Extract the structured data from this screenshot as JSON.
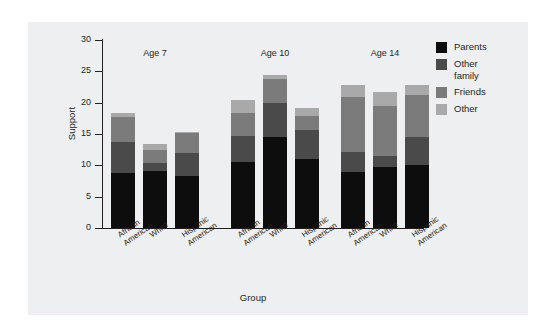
{
  "figure": {
    "background_color": "#ffffff",
    "panel_color": "#eeeff0",
    "axis_color": "#231f20"
  },
  "chart_data": {
    "type": "bar",
    "subtype": "stacked",
    "title": "",
    "xlabel": "Group",
    "ylabel": "Support",
    "ylim": [
      0,
      30
    ],
    "yticks": [
      0,
      5,
      10,
      15,
      20,
      25,
      30
    ],
    "ytick_labels": [
      "0",
      "5",
      "10",
      "15",
      "20",
      "25",
      "30"
    ],
    "grid": false,
    "legend_position": "right",
    "group_labels": [
      "Age 7",
      "Age 10",
      "Age 14"
    ],
    "categories": [
      "African\nAmerican",
      "White",
      "Hispanic\nAmerican",
      "African\nAmerican",
      "White",
      "Hispanic\nAmerican",
      "African\nAmerican",
      "White",
      "Hispanic\nAmerican"
    ],
    "series": [
      {
        "name": "Parents",
        "color": "#0d0d0d",
        "values": [
          8.8,
          9.1,
          8.3,
          10.6,
          14.6,
          11.0,
          9.0,
          9.7,
          10.0
        ]
      },
      {
        "name": "Other\nfamily",
        "color": "#4a4a4a",
        "values": [
          4.9,
          1.2,
          3.7,
          4.1,
          5.3,
          4.7,
          3.2,
          1.8,
          4.6
        ]
      },
      {
        "name": "Friends",
        "color": "#7b7b7b",
        "values": [
          4.0,
          2.2,
          3.1,
          3.7,
          3.9,
          2.2,
          8.7,
          8.0,
          6.6
        ]
      },
      {
        "name": "Other",
        "color": "#a9a9a9",
        "values": [
          0.7,
          0.9,
          0.3,
          2.1,
          0.7,
          1.2,
          2.0,
          2.2,
          1.6
        ]
      }
    ],
    "totals": [
      18.4,
      13.4,
      15.4,
      20.5,
      24.5,
      19.1,
      22.9,
      21.7,
      22.8
    ]
  },
  "legend": {
    "items": [
      {
        "label": "Parents",
        "color": "#0d0d0d"
      },
      {
        "label": "Other\nfamily",
        "color": "#4a4a4a"
      },
      {
        "label": "Friends",
        "color": "#7b7b7b"
      },
      {
        "label": "Other",
        "color": "#a9a9a9"
      }
    ]
  }
}
